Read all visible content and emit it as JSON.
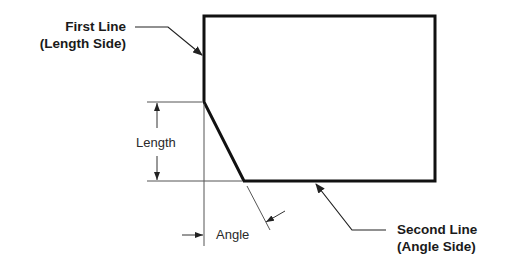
{
  "diagram": {
    "type": "chamfer-dimension-diagram",
    "labels": {
      "first_line": [
        "First Line",
        "(Length Side)"
      ],
      "second_line": [
        "Second Line",
        "(Angle Side)"
      ],
      "length": "Length",
      "angle": "Angle"
    },
    "colors": {
      "outline": "#111111",
      "dimension": "#444444",
      "text": "#1a1a1a"
    }
  }
}
